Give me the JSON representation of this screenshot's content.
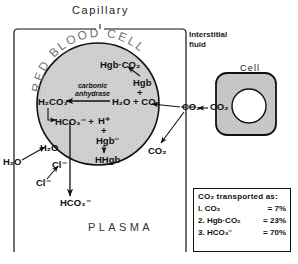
{
  "diagram": {
    "capillary_label": "Capillary",
    "interstitial_label_line1": "Interstitial",
    "interstitial_label_line2": "fluid",
    "cell_label": "Cell",
    "plasma_label": "PLASMA",
    "rbc_title_letters": [
      "R",
      "E",
      "D",
      "B",
      "L",
      "O",
      "O",
      "D",
      "C",
      "E",
      "L",
      "L"
    ],
    "rbc_title_text": "RED BLOOD CELL",
    "enzyme_line1": "carbonic",
    "enzyme_line2": "anhydrase"
  },
  "reactions": {
    "hgb_co2": "Hgb·CO₂",
    "hgb": "Hgb",
    "plus_upper": "+",
    "h2o_plus_co2": "H₂O + CO₂",
    "h2co3": "H₂CO₃",
    "hco3_plus": "HCO₃⁻ +",
    "h_plus": "H⁺",
    "plus_lower": "+",
    "hgb_minus": "Hgb⁻",
    "hhgb": "HHgb",
    "h2o_inside": "H₂O",
    "h2o_outside": "H₂O",
    "cl_inside": "Cl⁻",
    "cl_outside": "Cl⁻",
    "hco3_out": "HCO₃⁻",
    "co2_plasma": "CO₂",
    "co2_interstitial": "CO₂",
    "co2_cell": "CO₂"
  },
  "legend": {
    "title": "CO₂ transported as:",
    "rows": [
      {
        "index": "l.",
        "name": "CO₂",
        "eq": "=",
        "value": "7%"
      },
      {
        "index": "2.",
        "name": "Hgb·CO₂",
        "eq": "=",
        "value": "23%"
      },
      {
        "index": "3.",
        "name": "HCO₃⁻",
        "eq": "=",
        "value": "70%"
      }
    ]
  },
  "colors": {
    "ink": "#111111",
    "rbc_fill": "#d2d2d2",
    "cell_fill": "#c9c9c9",
    "background": "#ffffff"
  }
}
